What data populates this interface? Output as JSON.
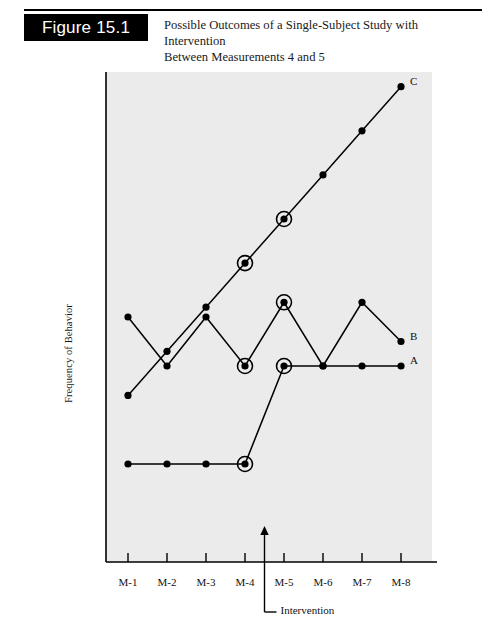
{
  "figure": {
    "badge_label": "Figure 15.1",
    "title_line1": "Possible Outcomes of a Single-Subject Study with Intervention",
    "title_line2": "Between Measurements 4 and 5"
  },
  "chart_data": {
    "type": "line",
    "title": "Possible Outcomes of a Single-Subject Study with Intervention Between Measurements 4 and 5",
    "xlabel": "",
    "ylabel": "Frequency of Behavior",
    "categories": [
      "M-1",
      "M-2",
      "M-3",
      "M-4",
      "M-5",
      "M-6",
      "M-7",
      "M-8"
    ],
    "ylim": [
      0,
      10
    ],
    "grid": false,
    "legend_position": "right-endpoint-labels",
    "highlight_points_at": [
      "M-4",
      "M-5"
    ],
    "series": [
      {
        "name": "A",
        "label": "A",
        "values": [
          2,
          2,
          2,
          2,
          4,
          4,
          4,
          4
        ]
      },
      {
        "name": "B",
        "label": "B",
        "values": [
          5,
          4,
          5,
          4,
          5.3,
          4,
          5.3,
          4.5
        ]
      },
      {
        "name": "C",
        "label": "C",
        "values": [
          3.4,
          4.3,
          5.2,
          6.1,
          7.0,
          7.9,
          8.8,
          9.7
        ]
      }
    ],
    "annotations": [
      {
        "name": "intervention",
        "text": "Intervention",
        "between": [
          "M-4",
          "M-5"
        ],
        "marker": "up-arrow"
      }
    ]
  },
  "axis": {
    "tick_labels": [
      "M-1",
      "M-2",
      "M-3",
      "M-4",
      "M-5",
      "M-6",
      "M-7",
      "M-8"
    ],
    "y_axis_title": "Frequency of Behavior"
  },
  "colors": {
    "plot_background": "#ebebeb",
    "ink": "#000000",
    "badge_background": "#000000",
    "badge_text": "#ffffff"
  }
}
